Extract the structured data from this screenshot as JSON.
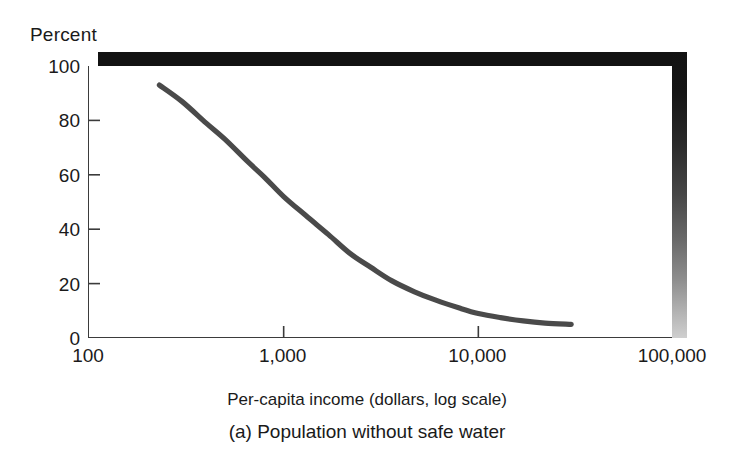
{
  "figure": {
    "y_axis_title": "Percent",
    "x_axis_title": "Per-capita income (dollars, log scale)",
    "caption": "(a) Population without safe water"
  },
  "colors": {
    "curve": "#4a4a4a",
    "axis": "#3b3b3b",
    "shadow_dark": "#121212",
    "shadow_light": "#cfcfcf",
    "background": "#ffffff",
    "text": "#1a1a1a"
  },
  "chart_data": {
    "type": "line",
    "title": "(a) Population without safe water",
    "xlabel": "Per-capita income (dollars, log scale)",
    "ylabel": "Percent",
    "xscale": "log",
    "yscale": "linear",
    "xlim": [
      100,
      100000
    ],
    "ylim": [
      0,
      100
    ],
    "grid": false,
    "legend": null,
    "xticks": [
      100,
      1000,
      10000,
      100000
    ],
    "xticklabels": [
      "100",
      "1,000",
      "10,000",
      "100,000"
    ],
    "yticks": [
      0,
      20,
      40,
      60,
      80,
      100
    ],
    "yticklabels": [
      "0",
      "20",
      "40",
      "60",
      "80",
      "100"
    ],
    "series": [
      {
        "name": "Population without safe water",
        "x": [
          230,
          300,
          400,
          500,
          650,
          800,
          1000,
          1300,
          1700,
          2200,
          2800,
          3600,
          4700,
          6000,
          8000,
          10000,
          13000,
          17000,
          22000,
          30000
        ],
        "y": [
          93,
          87,
          79,
          73,
          65,
          59,
          52,
          45,
          38,
          31,
          26,
          21,
          17,
          14,
          11,
          9,
          7.5,
          6.3,
          5.5,
          5
        ]
      }
    ]
  }
}
